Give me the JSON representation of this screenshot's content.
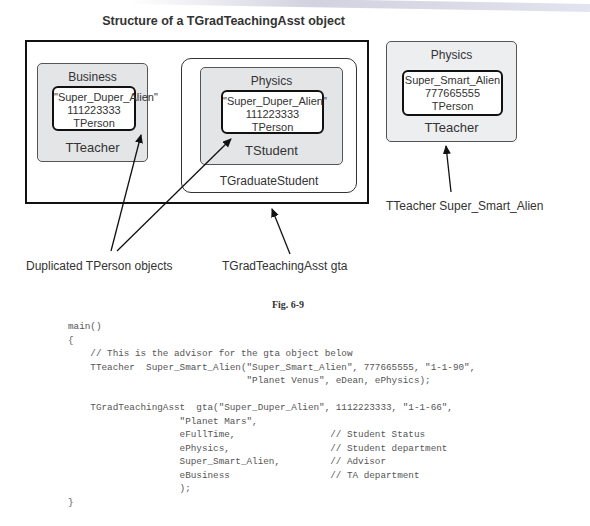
{
  "diagram": {
    "title": "Structure of a TGradTeachingAsst object",
    "gta_object": {
      "teacher_part": {
        "department": "Business",
        "class_name": "TTeacher",
        "person": {
          "name": "\"Super_Duper_Alien\"",
          "ssn": "111223333",
          "class_name": "TPerson"
        }
      },
      "graduate_student_part": {
        "class_name": "TGraduateStudent",
        "student": {
          "department": "Physics",
          "class_name": "TStudent",
          "person": {
            "name": "\"Super_Duper_Alien\"",
            "ssn": "111223333",
            "class_name": "TPerson"
          }
        }
      }
    },
    "advisor_object": {
      "department": "Physics",
      "class_name": "TTeacher",
      "person": {
        "name": "Super_Smart_Alien",
        "ssn": "777665555",
        "class_name": "TPerson"
      }
    },
    "annotations": {
      "duplicated": "Duplicated TPerson objects",
      "gta": "TGradTeachingAsst gta",
      "advisor": "TTeacher Super_Smart_Alien"
    },
    "figure_caption": "Fig. 6-9"
  },
  "code": {
    "lines": [
      "main()",
      "{",
      "    // This is the advisor for the gta object below",
      "    TTeacher  Super_Smart_Alien(\"Super_Smart_Alien\", 777665555, \"1-1-90\",",
      "                                \"Planet Venus\", eDean, ePhysics);",
      "",
      "    TGradTeachingAsst  gta(\"Super_Duper_Alien\", 1112223333, \"1-1-66\",",
      "                    \"Planet Mars\",",
      "                    eFullTime,                 // Student Status",
      "                    ePhysics,                  // Student department",
      "                    Super_Smart_Alien,         // Advisor",
      "                    eBusiness                  // TA department",
      "                    );",
      "}"
    ]
  }
}
